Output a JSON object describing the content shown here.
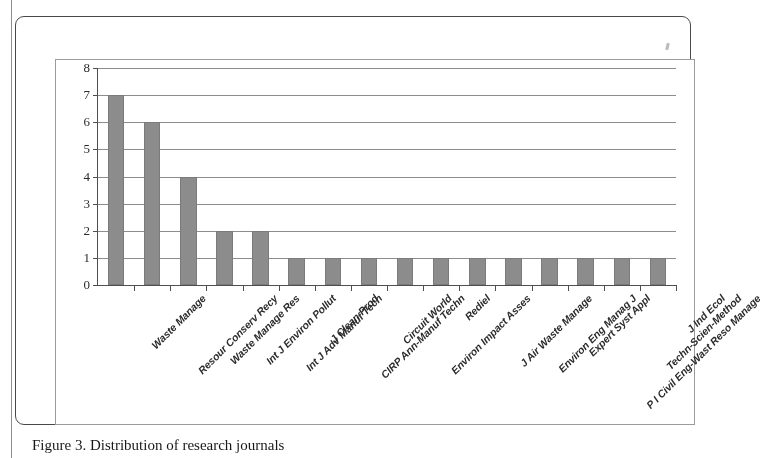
{
  "figure": {
    "caption": "Figure 3. Distribution of research journals",
    "bar_color": "#8c8c8c",
    "grid_color": "#8d8d8d",
    "axis_color": "#4f4f4f"
  },
  "chart_data": {
    "type": "bar",
    "title": "",
    "xlabel": "",
    "ylabel": "",
    "ylim": [
      0,
      8
    ],
    "yticks": [
      0,
      1,
      2,
      3,
      4,
      5,
      6,
      7,
      8
    ],
    "grid": true,
    "legend": false,
    "categories": [
      "Waste Manage",
      "Resour Conserv Recy",
      "Waste Manage Res",
      "Int J Environ Pollut",
      "Int J Adv Manuf Tech",
      "J Clean Prod",
      "CIRP Ann-Manuf Techn",
      "Circuit World",
      "Environ Impact Asses",
      "Rediel",
      "J Air Waste Manage",
      "Environ Eng Manag J",
      "Expert Syst Appl",
      "P I Civil Eng-Wast Reso Manage",
      "Techn-Scien-Method",
      "J Ind Ecol"
    ],
    "values": [
      7,
      6,
      4,
      2,
      2,
      1,
      1,
      1,
      1,
      1,
      1,
      1,
      1,
      1,
      1,
      1
    ]
  }
}
